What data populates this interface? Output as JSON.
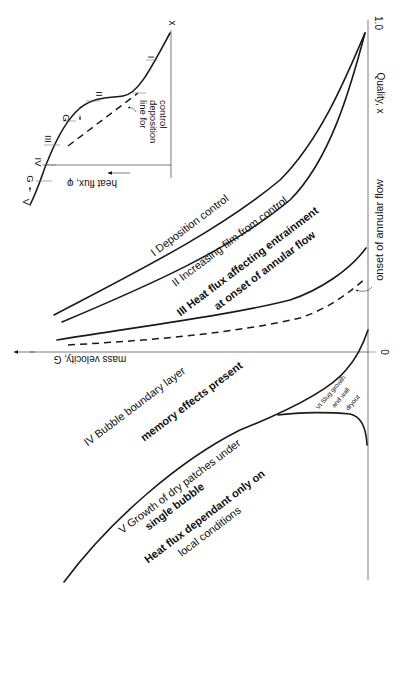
{
  "diagram": {
    "type": "flow-regime-map",
    "orientation": "rotated 90deg clockwise",
    "main_axes": {
      "x_label": "Quality, x",
      "x_ticks": [
        "0",
        "1.0"
      ],
      "y_label": "mass velocity, G"
    },
    "regions": [
      {
        "id": "I",
        "label": "I  Deposition control"
      },
      {
        "id": "II",
        "label": "II  Increasing film from control"
      },
      {
        "id": "III",
        "label_line1": "III  Heat flux affecting entrainment",
        "label_line2": "at onset of annular flow"
      },
      {
        "id": "IV",
        "label_line1": "IV Bubble boundary layer",
        "label_line2": "memory effects present"
      },
      {
        "id": "V",
        "label_line1": "V Growth of dry patches under",
        "label_line2": "single bubble",
        "label_line3": "Heat flux dependant only on",
        "label_line4": "local conditions"
      },
      {
        "id": "VI",
        "label_line1": "VI Slug growth",
        "label_line2": "and wall",
        "label_line3": "dryout"
      }
    ],
    "annotations": {
      "onset": "onset of annular flow"
    },
    "inset": {
      "x_label": "x",
      "y_label": "heat flux, φ",
      "g_arrow_label": "G",
      "curve_marks": [
        "V",
        "G",
        "IV",
        "III",
        "G",
        "II",
        "I"
      ],
      "deposition_note_line1": "line for",
      "deposition_note_line2": "deposition",
      "deposition_note_line3": "control"
    }
  }
}
